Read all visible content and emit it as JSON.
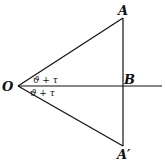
{
  "figure": {
    "background": "#ffffff",
    "ink": "#111111",
    "points": {
      "O": {
        "label": "O",
        "x": 18,
        "y": 86
      },
      "A": {
        "label": "A",
        "x": 123,
        "y": 18
      },
      "B": {
        "label": "B",
        "x": 123,
        "y": 86
      },
      "A_prime": {
        "label": "A′",
        "x": 123,
        "y": 146
      }
    },
    "angles": {
      "upper": {
        "label": "ϑ + τ"
      },
      "lower": {
        "label": "ϑ + τ"
      }
    }
  }
}
